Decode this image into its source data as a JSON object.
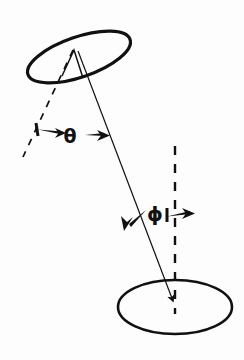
{
  "figure": {
    "title": "",
    "background_color": "#fdfdfd",
    "ink_color": "#111111",
    "width": 244,
    "height": 360
  },
  "labels": {
    "theta": "θ",
    "phi": "ϕ"
  },
  "diagram_data": {
    "type": "geometric-angle-diagram",
    "description": "Two elliptical rings connected by a slanted axis line, with dashed reference lines defining the angles theta and phi.",
    "elements": [
      {
        "name": "upper-ellipse",
        "kind": "ellipse",
        "cx": 79,
        "cy": 57,
        "rx": 54,
        "ry": 20,
        "rotation_deg": -19,
        "stroke_width": 3.2,
        "filled": false
      },
      {
        "name": "lower-ellipse",
        "kind": "ellipse",
        "cx": 175,
        "cy": 307,
        "rx": 57,
        "ry": 27,
        "rotation_deg": 0,
        "stroke_width": 2.6,
        "filled": false
      },
      {
        "name": "axis-line",
        "kind": "line-with-arrow",
        "x1": 78,
        "y1": 51,
        "x2": 173,
        "y2": 303,
        "stroke_width": 1.2,
        "arrow_at": "end"
      },
      {
        "name": "normal-dashed-line",
        "kind": "dashed-line-with-caret",
        "x1": 72,
        "y1": 48,
        "x2": 22,
        "y2": 158,
        "stroke_width": 1.6,
        "dash": "6,6"
      },
      {
        "name": "vertical-dashed-line",
        "kind": "dashed-line",
        "x1": 175,
        "y1": 146,
        "x2": 175,
        "y2": 312,
        "stroke_width": 2.4,
        "dash": "9,9"
      },
      {
        "name": "theta-left-arrow",
        "kind": "arrow",
        "tail_x": 74,
        "tail_y": 133,
        "tip_x": 42,
        "tip_y": 128,
        "points_toward": "normal-dashed-line"
      },
      {
        "name": "theta-right-arrow",
        "kind": "arrow",
        "tail_x": 86,
        "tail_y": 138,
        "tip_x": 112,
        "tip_y": 136,
        "points_toward": "axis-line"
      },
      {
        "name": "phi-left-arrow",
        "kind": "arrow",
        "tail_x": 148,
        "tail_y": 212,
        "tip_x": 124,
        "tip_y": 230,
        "points_toward": "axis-line"
      },
      {
        "name": "phi-right-arrow",
        "kind": "arrow",
        "tail_x": 168,
        "tail_y": 214,
        "tip_x": 196,
        "tip_y": 216,
        "points_toward": "vertical-dashed-line"
      },
      {
        "name": "theta-label",
        "kind": "text-label",
        "x": 70,
        "y": 142,
        "text_key": "labels.theta",
        "font_size": 19
      },
      {
        "name": "phi-label",
        "kind": "text-label",
        "x": 155,
        "y": 217,
        "text_key": "labels.phi",
        "font_size": 19
      }
    ],
    "angles": [
      {
        "symbol": "θ",
        "between": [
          "normal-dashed-line",
          "axis-line"
        ],
        "vertex": "upper-ellipse-center"
      },
      {
        "symbol": "ϕ",
        "between": [
          "axis-line",
          "vertical-dashed-line"
        ],
        "vertex": "lower-ellipse-center"
      }
    ]
  }
}
